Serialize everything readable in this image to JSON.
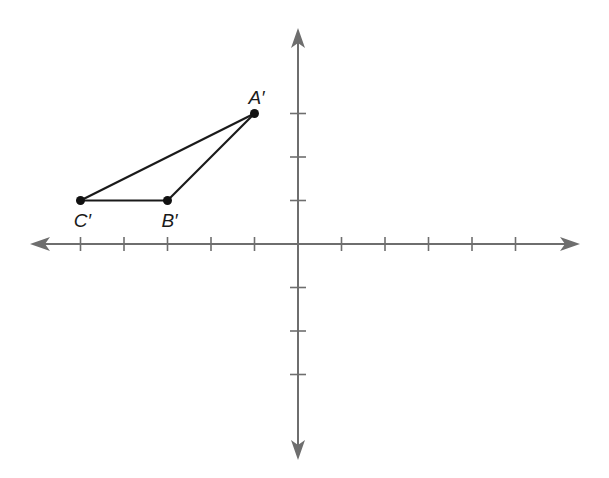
{
  "diagram": {
    "type": "coordinate-plane",
    "axes": {
      "x_range": [
        -6,
        6
      ],
      "y_range": [
        -4,
        4
      ],
      "tick_spacing": 1,
      "tick_labels_shown": false,
      "arrows_both_ends": true,
      "color": "#6e6e6e"
    },
    "points": [
      {
        "id": "A",
        "label": "A′",
        "x": -1,
        "y": 3,
        "label_position": "above"
      },
      {
        "id": "B",
        "label": "B′",
        "x": -3,
        "y": 1,
        "label_position": "below"
      },
      {
        "id": "C",
        "label": "C′",
        "x": -5,
        "y": 1,
        "label_position": "below"
      }
    ],
    "segments": [
      {
        "from": "A",
        "to": "B"
      },
      {
        "from": "B",
        "to": "C"
      },
      {
        "from": "C",
        "to": "A"
      }
    ],
    "shape_color": "#1a1a1a"
  }
}
